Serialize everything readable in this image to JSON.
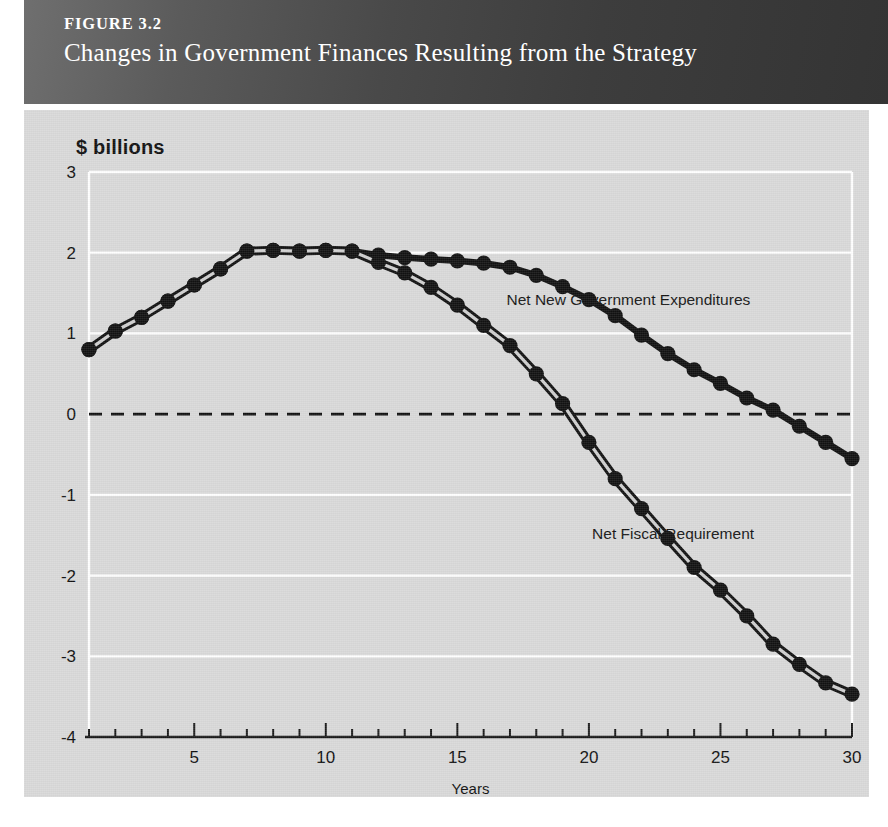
{
  "figure": {
    "number": "FIGURE 3.2",
    "title": "Changes in Government Finances Resulting from the Strategy"
  },
  "axis_unit_label": "$ billions",
  "chart_data": {
    "type": "line",
    "title": "Changes in Government Finances Resulting from the Strategy",
    "subtitle": "FIGURE 3.2",
    "xlabel": "Years",
    "ylabel": "$ billions",
    "xlim": [
      1,
      30
    ],
    "ylim": [
      -4,
      3
    ],
    "yticks": [
      3,
      2,
      1,
      0,
      -1,
      -2,
      -3,
      -4
    ],
    "ytick_labels": [
      "3",
      "2",
      "1",
      "0",
      "-1",
      "-2",
      "-3",
      "-4"
    ],
    "xticks": [
      5,
      10,
      15,
      20,
      25,
      30
    ],
    "xtick_labels": [
      "5",
      "10",
      "15",
      "20",
      "25",
      "30"
    ],
    "minor_xticks_every": 1,
    "grid": "horizontal-white",
    "zero_line": "dashed-black",
    "legend": "inline-annotations",
    "x": [
      1,
      2,
      3,
      4,
      5,
      6,
      7,
      8,
      9,
      10,
      11,
      12,
      13,
      14,
      15,
      16,
      17,
      18,
      19,
      20,
      21,
      22,
      23,
      24,
      25,
      26,
      27,
      28,
      29,
      30
    ],
    "series": [
      {
        "name": "Net New Government Expenditures",
        "label_x": 21.5,
        "label_y": 1.35,
        "style": "solid-thick-dots",
        "values": [
          0.8,
          1.03,
          1.2,
          1.4,
          1.6,
          1.8,
          2.02,
          2.03,
          2.02,
          2.03,
          2.02,
          1.97,
          1.94,
          1.92,
          1.9,
          1.87,
          1.82,
          1.72,
          1.58,
          1.42,
          1.22,
          0.98,
          0.75,
          0.55,
          0.38,
          0.2,
          0.05,
          -0.15,
          -0.35,
          -0.55
        ]
      },
      {
        "name": "Net Fiscal Requirement",
        "label_x": 23.2,
        "label_y": -1.55,
        "style": "double-line-dots",
        "values": [
          0.8,
          1.03,
          1.2,
          1.4,
          1.6,
          1.8,
          2.02,
          2.03,
          2.02,
          2.03,
          2.02,
          1.88,
          1.75,
          1.57,
          1.35,
          1.1,
          0.85,
          0.5,
          0.13,
          -0.35,
          -0.8,
          -1.17,
          -1.54,
          -1.9,
          -2.18,
          -2.5,
          -2.85,
          -3.1,
          -3.33,
          -3.47
        ]
      }
    ]
  },
  "colors": {
    "panel_bg": "#d9d9d9",
    "grid": "#ffffff",
    "series_ink": "#111111",
    "banner_dark": "#343434",
    "banner_light": "#6f6f6f"
  }
}
